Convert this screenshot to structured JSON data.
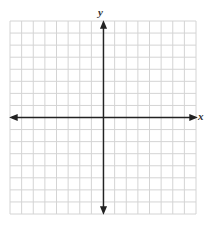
{
  "graph": {
    "x_label": "x",
    "y_label": "y",
    "grid": {
      "columns": 16,
      "rows": 16
    },
    "colors": {
      "grid": "#d4d4d4",
      "axis": "#222222"
    }
  }
}
